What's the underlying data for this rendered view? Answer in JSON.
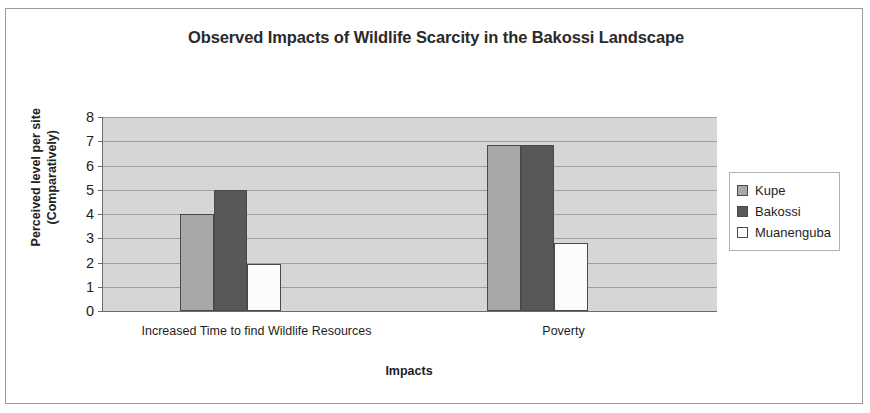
{
  "chart_data": {
    "type": "bar",
    "title": "Observed Impacts of Wildlife Scarcity in the Bakossi Landscape",
    "xlabel": "Impacts",
    "ylabel": "Perceived level per site (Comparatively)",
    "categories": [
      "Increased Time to find Wildlife Resources",
      "Poverty"
    ],
    "series": [
      {
        "name": "Kupe",
        "values": [
          4.0,
          6.85
        ],
        "color": "#a8a8a8"
      },
      {
        "name": "Bakossi",
        "values": [
          5.0,
          6.85
        ],
        "color": "#585858"
      },
      {
        "name": "Muanenguba",
        "values": [
          1.95,
          2.8
        ],
        "color": "#fcfcfc"
      }
    ],
    "ylim": [
      0,
      8
    ],
    "y_ticks": [
      0,
      1,
      2,
      3,
      4,
      5,
      6,
      7,
      8
    ],
    "grid": true,
    "legend_position": "right",
    "plot_background": "#d6d6d6",
    "gridline_color": "#9e9e9e",
    "axis_color": "#6b6b6b",
    "bar_border_color": "#4a4a4a"
  }
}
